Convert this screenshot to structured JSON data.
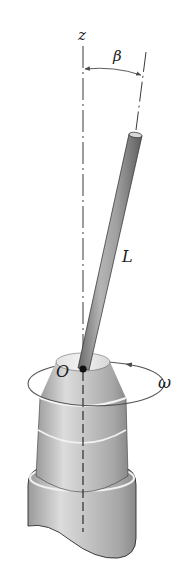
{
  "figure": {
    "labels": {
      "z_axis": "z",
      "angle": "β",
      "length": "L",
      "origin": "O",
      "angular_velocity": "ω"
    },
    "colors": {
      "line": "#3a3a3a",
      "rod_light": "#c8c8c8",
      "rod_dark": "#6e6e6e",
      "base_light": "#e4e4e4",
      "base_dark": "#8a8a8a",
      "highlight": "#f4f4f4"
    }
  }
}
